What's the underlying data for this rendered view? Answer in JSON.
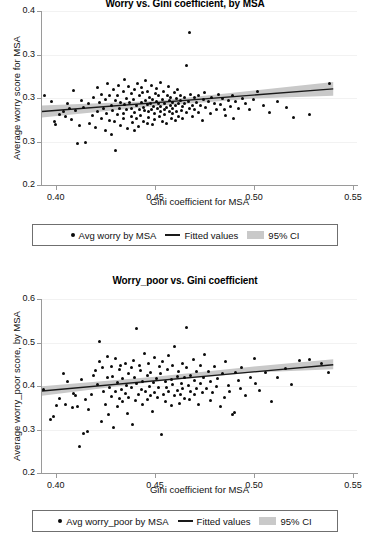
{
  "figure": {
    "background": "#ffffff",
    "point_color": "#0a0a0a",
    "line_color": "#1a1a1a",
    "ci_color": "#c9c9c9",
    "axis_color": "#9a9a9a"
  },
  "panels": [
    {
      "title": "Worry vs. Gini coefficient, by MSA",
      "ylabel": "Average worry score for MSA",
      "xlabel": "Gini coefficient for MSA",
      "legend": {
        "points_label": "Avg worry by MSA",
        "line_label": "Fitted values",
        "band_label": "95% CI"
      }
    },
    {
      "title": "Worry_poor vs. Gini coefficient",
      "ylabel": "Average worry_poor score, by MSA",
      "xlabel": "Gini coefficient for MSA",
      "legend": {
        "points_label": "Avg worry_poor by MSA",
        "line_label": "Fitted values",
        "band_label": "95% CI"
      }
    }
  ],
  "chart_data": [
    {
      "type": "scatter",
      "title": "Worry vs. Gini coefficient, by MSA",
      "xlabel": "Gini coefficient for MSA",
      "ylabel": "Average worry score for MSA",
      "xlim": [
        0.393,
        0.552
      ],
      "ylim": [
        0.2,
        0.4
      ],
      "xticks": [
        0.4,
        0.45,
        0.5,
        0.55
      ],
      "xtick_labels": [
        "0.40",
        "0.45",
        "0.50",
        "0.55"
      ],
      "yticks": [
        0.2,
        0.25,
        0.3,
        0.35,
        0.4
      ],
      "ytick_labels": [
        "0.2",
        "0.3",
        "0.3",
        "0.3",
        "0.4"
      ],
      "grid": "horizontal-faint",
      "legend_position": "below-axes",
      "series": [
        {
          "name": "Avg worry by MSA",
          "type": "scatter",
          "marker": "filled-circle",
          "x": [
            0.394,
            0.398,
            0.399,
            0.4,
            0.402,
            0.404,
            0.405,
            0.406,
            0.407,
            0.408,
            0.409,
            0.41,
            0.411,
            0.412,
            0.413,
            0.414,
            0.415,
            0.416,
            0.417,
            0.418,
            0.419,
            0.42,
            0.421,
            0.421,
            0.422,
            0.423,
            0.423,
            0.424,
            0.425,
            0.425,
            0.426,
            0.426,
            0.427,
            0.427,
            0.428,
            0.428,
            0.429,
            0.429,
            0.43,
            0.43,
            0.43,
            0.431,
            0.431,
            0.432,
            0.432,
            0.433,
            0.433,
            0.434,
            0.434,
            0.434,
            0.435,
            0.435,
            0.436,
            0.436,
            0.436,
            0.437,
            0.437,
            0.438,
            0.438,
            0.438,
            0.439,
            0.439,
            0.44,
            0.44,
            0.44,
            0.441,
            0.441,
            0.441,
            0.442,
            0.442,
            0.442,
            0.443,
            0.443,
            0.443,
            0.444,
            0.444,
            0.444,
            0.445,
            0.445,
            0.445,
            0.446,
            0.446,
            0.446,
            0.447,
            0.447,
            0.447,
            0.448,
            0.448,
            0.448,
            0.449,
            0.449,
            0.449,
            0.45,
            0.45,
            0.45,
            0.451,
            0.451,
            0.451,
            0.452,
            0.452,
            0.452,
            0.453,
            0.453,
            0.453,
            0.454,
            0.454,
            0.454,
            0.455,
            0.455,
            0.455,
            0.456,
            0.456,
            0.456,
            0.457,
            0.457,
            0.457,
            0.458,
            0.458,
            0.458,
            0.459,
            0.459,
            0.459,
            0.46,
            0.46,
            0.46,
            0.461,
            0.461,
            0.461,
            0.462,
            0.462,
            0.463,
            0.463,
            0.463,
            0.464,
            0.464,
            0.465,
            0.465,
            0.466,
            0.466,
            0.467,
            0.467,
            0.468,
            0.468,
            0.469,
            0.469,
            0.47,
            0.47,
            0.471,
            0.472,
            0.472,
            0.473,
            0.474,
            0.474,
            0.475,
            0.476,
            0.477,
            0.478,
            0.479,
            0.48,
            0.481,
            0.482,
            0.483,
            0.484,
            0.485,
            0.486,
            0.487,
            0.488,
            0.489,
            0.49,
            0.491,
            0.492,
            0.494,
            0.496,
            0.498,
            0.5,
            0.502,
            0.505,
            0.508,
            0.512,
            0.516,
            0.52,
            0.528,
            0.538
          ],
          "y": [
            0.303,
            0.296,
            0.272,
            0.27,
            0.281,
            0.285,
            0.278,
            0.293,
            0.288,
            0.275,
            0.309,
            0.286,
            0.247,
            0.268,
            0.297,
            0.289,
            0.248,
            0.293,
            0.271,
            0.279,
            0.301,
            0.266,
            0.284,
            0.312,
            0.294,
            0.277,
            0.305,
            0.288,
            0.263,
            0.299,
            0.316,
            0.282,
            0.274,
            0.304,
            0.291,
            0.258,
            0.286,
            0.31,
            0.24,
            0.273,
            0.297,
            0.302,
            0.281,
            0.288,
            0.315,
            0.269,
            0.295,
            0.283,
            0.307,
            0.276,
            0.292,
            0.321,
            0.286,
            0.264,
            0.3,
            0.294,
            0.313,
            0.279,
            0.305,
            0.288,
            0.272,
            0.298,
            0.309,
            0.284,
            0.262,
            0.291,
            0.317,
            0.276,
            0.303,
            0.287,
            0.268,
            0.295,
            0.312,
            0.281,
            0.289,
            0.306,
            0.274,
            0.298,
            0.32,
            0.285,
            0.292,
            0.271,
            0.308,
            0.284,
            0.301,
            0.277,
            0.294,
            0.314,
            0.286,
            0.269,
            0.299,
            0.29,
            0.305,
            0.282,
            0.275,
            0.296,
            0.311,
            0.287,
            0.293,
            0.279,
            0.302,
            0.284,
            0.318,
            0.291,
            0.273,
            0.298,
            0.307,
            0.286,
            0.294,
            0.281,
            0.303,
            0.289,
            0.27,
            0.297,
            0.313,
            0.285,
            0.292,
            0.276,
            0.3,
            0.288,
            0.295,
            0.282,
            0.306,
            0.291,
            0.274,
            0.299,
            0.285,
            0.31,
            0.293,
            0.279,
            0.297,
            0.286,
            0.303,
            0.29,
            0.276,
            0.301,
            0.294,
            0.338,
            0.283,
            0.375,
            0.296,
            0.288,
            0.305,
            0.292,
            0.278,
            0.3,
            0.287,
            0.295,
            0.302,
            0.284,
            0.291,
            0.298,
            0.275,
            0.306,
            0.289,
            0.296,
            0.283,
            0.301,
            0.294,
            0.287,
            0.304,
            0.292,
            0.299,
            0.286,
            0.281,
            0.297,
            0.29,
            0.303,
            0.276,
            0.295,
            0.288,
            0.3,
            0.293,
            0.286,
            0.298,
            0.307,
            0.291,
            0.284,
            0.296,
            0.289,
            0.278,
            0.281,
            0.316
          ]
        },
        {
          "name": "Fitted values",
          "type": "line",
          "x": [
            0.393,
            0.54
          ],
          "y": [
            0.2845,
            0.3105
          ]
        },
        {
          "name": "95% CI",
          "type": "band",
          "x": [
            0.393,
            0.45,
            0.5,
            0.54
          ],
          "y_lower": [
            0.2775,
            0.2905,
            0.2995,
            0.3025
          ],
          "y_upper": [
            0.2915,
            0.2965,
            0.3085,
            0.3185
          ]
        }
      ]
    },
    {
      "type": "scatter",
      "title": "Worry_poor vs. Gini coefficient",
      "xlabel": "Gini coefficient for MSA",
      "ylabel": "Average worry_poor score, by MSA",
      "xlim": [
        0.393,
        0.552
      ],
      "ylim": [
        0.2,
        0.6
      ],
      "xticks": [
        0.4,
        0.45,
        0.5,
        0.55
      ],
      "xtick_labels": [
        "0.40",
        "0.45",
        "0.50",
        "0.55"
      ],
      "yticks": [
        0.2,
        0.3,
        0.4,
        0.5,
        0.6
      ],
      "ytick_labels": [
        "0.2",
        "0.3",
        "0.4",
        "0.5",
        "0.6"
      ],
      "grid": "horizontal-faint",
      "legend_position": "below-axes",
      "series": [
        {
          "name": "Avg worry_poor by MSA",
          "type": "scatter",
          "marker": "filled-circle",
          "x": [
            0.394,
            0.397,
            0.399,
            0.4,
            0.402,
            0.404,
            0.405,
            0.406,
            0.408,
            0.409,
            0.41,
            0.411,
            0.412,
            0.413,
            0.414,
            0.415,
            0.416,
            0.417,
            0.418,
            0.419,
            0.42,
            0.421,
            0.422,
            0.422,
            0.423,
            0.424,
            0.424,
            0.425,
            0.426,
            0.426,
            0.427,
            0.427,
            0.428,
            0.428,
            0.429,
            0.429,
            0.43,
            0.43,
            0.431,
            0.431,
            0.432,
            0.432,
            0.433,
            0.433,
            0.434,
            0.434,
            0.435,
            0.435,
            0.436,
            0.436,
            0.437,
            0.437,
            0.438,
            0.438,
            0.439,
            0.439,
            0.44,
            0.44,
            0.441,
            0.441,
            0.442,
            0.442,
            0.443,
            0.443,
            0.444,
            0.444,
            0.445,
            0.445,
            0.446,
            0.446,
            0.447,
            0.447,
            0.448,
            0.448,
            0.449,
            0.449,
            0.45,
            0.45,
            0.451,
            0.451,
            0.452,
            0.452,
            0.453,
            0.453,
            0.454,
            0.454,
            0.455,
            0.455,
            0.456,
            0.456,
            0.457,
            0.457,
            0.458,
            0.458,
            0.459,
            0.459,
            0.46,
            0.46,
            0.461,
            0.461,
            0.462,
            0.462,
            0.463,
            0.463,
            0.464,
            0.464,
            0.465,
            0.465,
            0.466,
            0.466,
            0.467,
            0.467,
            0.468,
            0.468,
            0.469,
            0.47,
            0.47,
            0.471,
            0.471,
            0.472,
            0.473,
            0.473,
            0.474,
            0.475,
            0.475,
            0.476,
            0.477,
            0.478,
            0.478,
            0.479,
            0.48,
            0.481,
            0.482,
            0.483,
            0.484,
            0.485,
            0.486,
            0.487,
            0.488,
            0.489,
            0.49,
            0.491,
            0.492,
            0.493,
            0.494,
            0.496,
            0.498,
            0.5,
            0.501,
            0.503,
            0.506,
            0.509,
            0.512,
            0.516,
            0.519,
            0.523,
            0.528,
            0.534,
            0.538
          ],
          "y": [
            0.393,
            0.322,
            0.328,
            0.355,
            0.372,
            0.428,
            0.358,
            0.41,
            0.351,
            0.383,
            0.378,
            0.352,
            0.262,
            0.415,
            0.291,
            0.368,
            0.297,
            0.345,
            0.382,
            0.426,
            0.436,
            0.402,
            0.455,
            0.501,
            0.318,
            0.389,
            0.442,
            0.357,
            0.419,
            0.468,
            0.334,
            0.398,
            0.445,
            0.376,
            0.305,
            0.421,
            0.386,
            0.462,
            0.352,
            0.408,
            0.437,
            0.371,
            0.394,
            0.448,
            0.365,
            0.417,
            0.383,
            0.453,
            0.402,
            0.338,
            0.428,
            0.375,
            0.441,
            0.396,
            0.312,
            0.458,
            0.419,
            0.368,
            0.53,
            0.405,
            0.382,
            0.446,
            0.391,
            0.435,
            0.358,
            0.412,
            0.476,
            0.388,
            0.424,
            0.369,
            0.398,
            0.452,
            0.377,
            0.431,
            0.406,
            0.342,
            0.465,
            0.385,
            0.418,
            0.372,
            0.444,
            0.395,
            0.288,
            0.428,
            0.381,
            0.457,
            0.409,
            0.364,
            0.437,
            0.398,
            0.472,
            0.386,
            0.415,
            0.355,
            0.448,
            0.403,
            0.378,
            0.492,
            0.422,
            0.391,
            0.361,
            0.434,
            0.407,
            0.381,
            0.453,
            0.396,
            0.418,
            0.372,
            0.441,
            0.533,
            0.402,
            0.368,
            0.425,
            0.387,
            0.461,
            0.412,
            0.379,
            0.434,
            0.396,
            0.358,
            0.448,
            0.405,
            0.383,
            0.421,
            0.472,
            0.394,
            0.432,
            0.366,
            0.409,
            0.385,
            0.443,
            0.398,
            0.417,
            0.352,
            0.428,
            0.373,
            0.456,
            0.401,
            0.388,
            0.334,
            0.34,
            0.431,
            0.412,
            0.395,
            0.442,
            0.378,
            0.421,
            0.464,
            0.405,
            0.388,
            0.432,
            0.363,
            0.419,
            0.442,
            0.405,
            0.458,
            0.462,
            0.451,
            0.43
          ]
        },
        {
          "name": "Fitted values",
          "type": "line",
          "x": [
            0.393,
            0.54
          ],
          "y": [
            0.3885,
            0.449
          ]
        },
        {
          "name": "95% CI",
          "type": "band",
          "x": [
            0.393,
            0.45,
            0.5,
            0.54
          ],
          "y_lower": [
            0.3775,
            0.4095,
            0.431,
            0.4385
          ],
          "y_upper": [
            0.3995,
            0.4215,
            0.445,
            0.4615
          ]
        }
      ]
    }
  ]
}
